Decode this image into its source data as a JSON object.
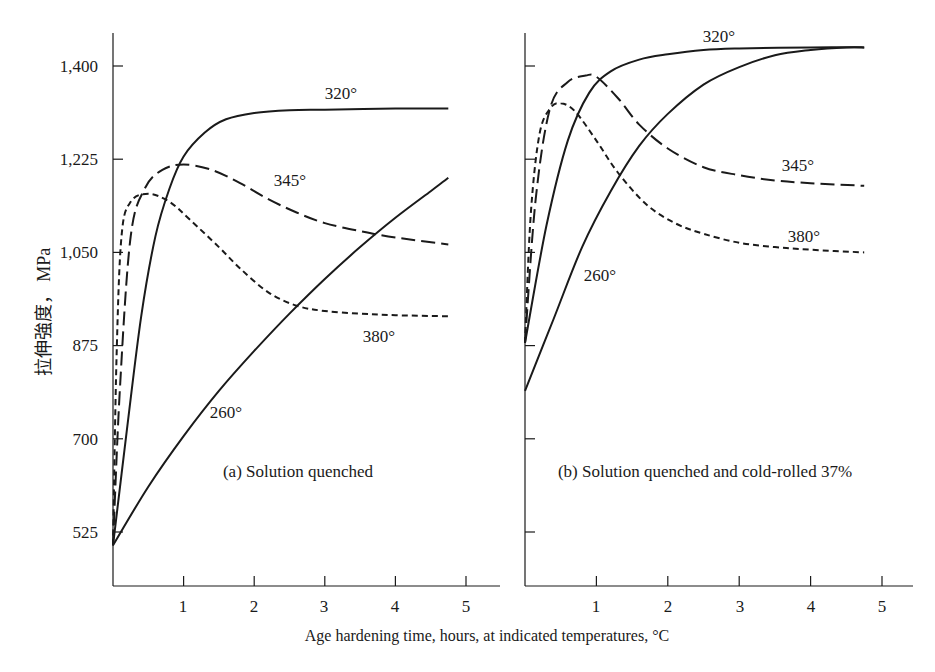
{
  "chart_data": [
    {
      "type": "line",
      "panel": "a",
      "caption": "(a) Solution quenched",
      "xlabel": "Age hardening time, hours, at indicated temperatures, °C",
      "ylabel": "拉伸強度， MPa",
      "xlim": [
        0,
        5.3
      ],
      "ylim": [
        420,
        1470
      ],
      "x_ticks": [
        "1",
        "2",
        "3",
        "4",
        "5"
      ],
      "y_ticks": [
        "525",
        "700",
        "875",
        "1,050",
        "1,225",
        "1,400"
      ],
      "grid": false,
      "series": [
        {
          "name": "320°",
          "style": "solid",
          "x": [
            0,
            0.2,
            0.4,
            0.6,
            0.8,
            1.0,
            1.3,
            1.6,
            2.0,
            2.5,
            3.0,
            4.0,
            4.75
          ],
          "y": [
            500,
            720,
            930,
            1080,
            1170,
            1230,
            1275,
            1300,
            1312,
            1317,
            1318,
            1320,
            1320
          ]
        },
        {
          "name": "345°",
          "style": "dashed",
          "x": [
            0,
            0.1,
            0.25,
            0.45,
            0.7,
            1.0,
            1.4,
            1.8,
            2.2,
            2.6,
            3.0,
            3.5,
            4.0,
            4.75
          ],
          "y": [
            500,
            800,
            1080,
            1170,
            1205,
            1215,
            1205,
            1180,
            1150,
            1125,
            1105,
            1090,
            1078,
            1065
          ]
        },
        {
          "name": "380°",
          "style": "short-dashed",
          "x": [
            0,
            0.05,
            0.12,
            0.25,
            0.5,
            0.8,
            1.1,
            1.5,
            1.8,
            2.2,
            2.6,
            3.0,
            3.5,
            4.0,
            4.75
          ],
          "y": [
            500,
            850,
            1080,
            1145,
            1160,
            1145,
            1110,
            1060,
            1020,
            975,
            950,
            940,
            935,
            932,
            930
          ]
        },
        {
          "name": "260°",
          "style": "solid",
          "x": [
            0,
            0.5,
            1.0,
            1.5,
            2.0,
            2.5,
            3.0,
            3.5,
            4.0,
            4.5,
            4.75
          ],
          "y": [
            500,
            610,
            705,
            790,
            865,
            935,
            1000,
            1060,
            1115,
            1165,
            1190
          ]
        }
      ],
      "annotations": [
        "320°",
        "345°",
        "380°",
        "260°"
      ]
    },
    {
      "type": "line",
      "panel": "b",
      "caption": "(b) Solution quenched and cold-rolled 37%",
      "xlabel": "Age hardening time, hours, at indicated temperatures, °C",
      "ylabel": "拉伸強度， MPa",
      "xlim": [
        0,
        5.3
      ],
      "ylim": [
        420,
        1470
      ],
      "x_ticks": [
        "1",
        "2",
        "3",
        "4",
        "5"
      ],
      "y_ticks": [
        "525",
        "700",
        "875",
        "1,050",
        "1,225",
        "1,400"
      ],
      "grid": false,
      "series": [
        {
          "name": "320°",
          "style": "solid",
          "x": [
            0,
            0.3,
            0.6,
            0.9,
            1.2,
            1.6,
            2.0,
            2.5,
            3.0,
            4.0,
            4.75
          ],
          "y": [
            880,
            1100,
            1260,
            1350,
            1390,
            1412,
            1422,
            1430,
            1433,
            1435,
            1435
          ]
        },
        {
          "name": "345°",
          "style": "dashed",
          "x": [
            0,
            0.15,
            0.35,
            0.6,
            0.85,
            1.0,
            1.3,
            1.6,
            2.0,
            2.5,
            3.0,
            3.5,
            4.0,
            4.75
          ],
          "y": [
            880,
            1150,
            1320,
            1370,
            1382,
            1380,
            1340,
            1290,
            1245,
            1210,
            1195,
            1185,
            1180,
            1175
          ]
        },
        {
          "name": "380°",
          "style": "short-dashed",
          "x": [
            0,
            0.08,
            0.2,
            0.35,
            0.5,
            0.7,
            1.0,
            1.3,
            1.7,
            2.1,
            2.5,
            3.0,
            3.5,
            4.0,
            4.75
          ],
          "y": [
            880,
            1120,
            1270,
            1320,
            1330,
            1315,
            1260,
            1200,
            1140,
            1105,
            1085,
            1068,
            1060,
            1055,
            1050
          ]
        },
        {
          "name": "260°",
          "style": "solid",
          "x": [
            0,
            0.4,
            0.8,
            1.2,
            1.6,
            2.0,
            2.5,
            3.0,
            3.5,
            4.0,
            4.5,
            4.75
          ],
          "y": [
            790,
            925,
            1060,
            1165,
            1250,
            1310,
            1365,
            1398,
            1420,
            1430,
            1435,
            1435
          ]
        }
      ],
      "annotations": [
        "320°",
        "345°",
        "380°",
        "260°"
      ]
    }
  ],
  "figure": {
    "ylabel": "拉伸強度， MPa",
    "xlabel": "Age hardening time, hours, at indicated temperatures, °C",
    "y_tick_labels": [
      "1,400",
      "1,225",
      "1,050",
      "875",
      "700",
      "525"
    ],
    "x_tick_labels": [
      "1",
      "2",
      "3",
      "4",
      "5"
    ],
    "panel_a": {
      "caption": "(a) Solution quenched",
      "labels": {
        "t320": "320°",
        "t345": "345°",
        "t380": "380°",
        "t260": "260°"
      }
    },
    "panel_b": {
      "caption": "(b) Solution quenched and cold-rolled 37%",
      "labels": {
        "t320": "320°",
        "t345": "345°",
        "t380": "380°",
        "t260": "260°"
      }
    },
    "line_color": "#1a1a1a"
  }
}
